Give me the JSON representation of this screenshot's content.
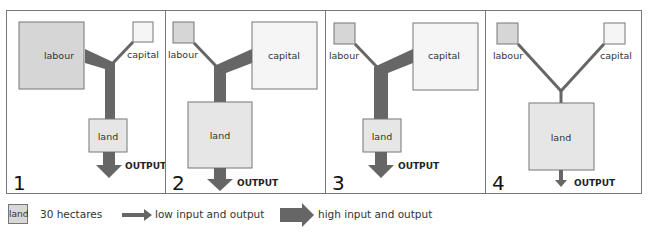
{
  "colors": {
    "frame": "#777777",
    "labour_fill": "#d6d6d6",
    "land_fill": "#e6e6e6",
    "capital_fill": "#f5f5f5",
    "box_stroke": "#777777",
    "flow": "#666666"
  },
  "panels": [
    {
      "number": "1",
      "labour": "labour",
      "capital": "capital",
      "land": "land",
      "output": "OUTPUT"
    },
    {
      "number": "2",
      "labour": "labour",
      "capital": "capital",
      "land": "land",
      "output": "OUTPUT"
    },
    {
      "number": "3",
      "labour": "labour",
      "capital": "capital",
      "land": "land",
      "output": "OUTPUT"
    },
    {
      "number": "4",
      "labour": "labour",
      "capital": "capital",
      "land": "land",
      "output": "OUTPUT"
    }
  ],
  "legend": {
    "land_box": "land",
    "land_desc": "30 hectares",
    "low": "low input and output",
    "high": "high input and output"
  }
}
